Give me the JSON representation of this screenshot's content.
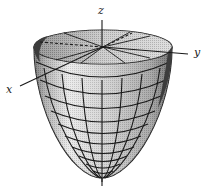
{
  "figure": {
    "type": "paraboloid-surface",
    "axes": {
      "x": {
        "label": "x"
      },
      "y": {
        "label": "y"
      },
      "z": {
        "label": "z"
      }
    },
    "colors": {
      "grid_line": "#1a1a1a",
      "surface_light": "#d8d8d8",
      "surface_mid": "#b5b5b5",
      "surface_dark": "#5a5a5a",
      "rim_inner": "#c4c4c4",
      "background": "#ffffff"
    }
  }
}
